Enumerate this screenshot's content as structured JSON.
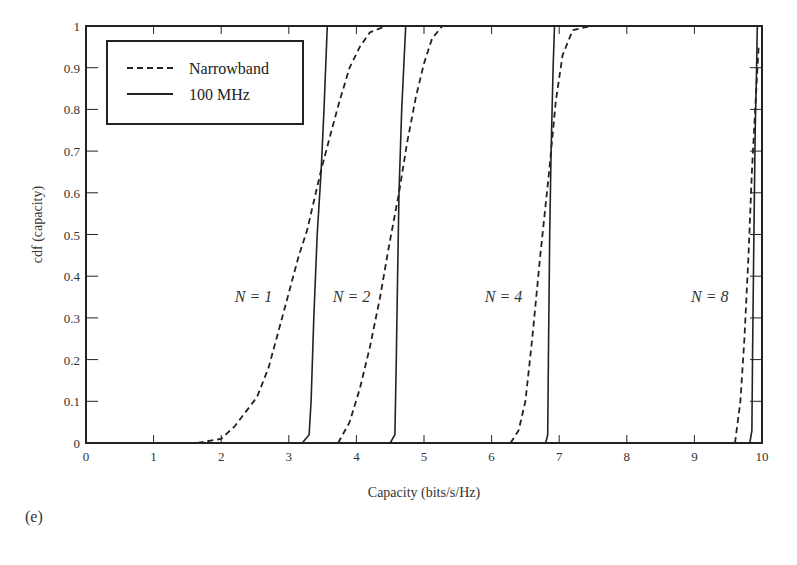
{
  "panel_label": "(e)",
  "chart_data": {
    "type": "line",
    "title": "",
    "xlabel": "Capacity (bits/s/Hz)",
    "ylabel": "cdf (capacity)",
    "xlim": [
      0,
      10
    ],
    "ylim": [
      0,
      1
    ],
    "xticks": [
      0,
      1,
      2,
      3,
      4,
      5,
      6,
      7,
      8,
      9,
      10
    ],
    "yticks": [
      0,
      0.1,
      0.2,
      0.3,
      0.4,
      0.5,
      0.6,
      0.7,
      0.8,
      0.9,
      1
    ],
    "ytick_labels": [
      "0",
      "0.1",
      "0.2",
      "0.3",
      "0.4",
      "0.5",
      "0.6",
      "0.7",
      "0.8",
      "0.9",
      "1"
    ],
    "grid": false,
    "legend": {
      "position": "upper left",
      "entries": [
        {
          "label": "Narrowband",
          "style": "dashed"
        },
        {
          "label": "100 MHz",
          "style": "solid"
        }
      ]
    },
    "annotations": [
      {
        "text": "N = 1",
        "x": 2.2,
        "y": 0.35
      },
      {
        "text": "N = 2",
        "x": 3.65,
        "y": 0.35
      },
      {
        "text": "N = 4",
        "x": 5.9,
        "y": 0.35
      },
      {
        "text": "N = 8",
        "x": 8.95,
        "y": 0.35
      }
    ],
    "series": [
      {
        "name": "Narrowband N=1",
        "style": "dashed",
        "points": [
          [
            1.65,
            0
          ],
          [
            2.0,
            0.01
          ],
          [
            2.2,
            0.04
          ],
          [
            2.53,
            0.11
          ],
          [
            2.7,
            0.18
          ],
          [
            2.85,
            0.27
          ],
          [
            3.0,
            0.36
          ],
          [
            3.15,
            0.45
          ],
          [
            3.27,
            0.51
          ],
          [
            3.4,
            0.6
          ],
          [
            3.48,
            0.655
          ],
          [
            3.6,
            0.73
          ],
          [
            3.75,
            0.82
          ],
          [
            3.9,
            0.9
          ],
          [
            4.05,
            0.95
          ],
          [
            4.2,
            0.985
          ],
          [
            4.44,
            1.0
          ]
        ]
      },
      {
        "name": "100 MHz N=1",
        "style": "solid",
        "points": [
          [
            3.2,
            0
          ],
          [
            3.3,
            0.02
          ],
          [
            3.33,
            0.1
          ],
          [
            3.37,
            0.3
          ],
          [
            3.42,
            0.5
          ],
          [
            3.48,
            0.655
          ],
          [
            3.52,
            0.8
          ],
          [
            3.57,
            1.0
          ]
        ]
      },
      {
        "name": "Narrowband N=2",
        "style": "dashed",
        "points": [
          [
            3.73,
            0
          ],
          [
            3.9,
            0.05
          ],
          [
            4.05,
            0.13
          ],
          [
            4.2,
            0.23
          ],
          [
            4.35,
            0.35
          ],
          [
            4.48,
            0.47
          ],
          [
            4.63,
            0.6
          ],
          [
            4.75,
            0.72
          ],
          [
            4.88,
            0.83
          ],
          [
            5.0,
            0.91
          ],
          [
            5.12,
            0.97
          ],
          [
            5.27,
            1.0
          ]
        ]
      },
      {
        "name": "100 MHz N=2",
        "style": "solid",
        "points": [
          [
            4.5,
            0
          ],
          [
            4.57,
            0.02
          ],
          [
            4.59,
            0.2
          ],
          [
            4.61,
            0.4
          ],
          [
            4.63,
            0.6
          ],
          [
            4.67,
            0.8
          ],
          [
            4.73,
            1.0
          ]
        ]
      },
      {
        "name": "Narrowband N=4",
        "style": "dashed",
        "points": [
          [
            6.28,
            0
          ],
          [
            6.4,
            0.03
          ],
          [
            6.5,
            0.1
          ],
          [
            6.6,
            0.25
          ],
          [
            6.72,
            0.45
          ],
          [
            6.85,
            0.65
          ],
          [
            6.95,
            0.82
          ],
          [
            7.05,
            0.93
          ],
          [
            7.2,
            0.99
          ],
          [
            7.47,
            1.0
          ]
        ]
      },
      {
        "name": "100 MHz N=4",
        "style": "solid",
        "points": [
          [
            6.8,
            0
          ],
          [
            6.83,
            0.02
          ],
          [
            6.84,
            0.2
          ],
          [
            6.86,
            0.5
          ],
          [
            6.88,
            0.7
          ],
          [
            6.91,
            0.9
          ],
          [
            6.93,
            1.0
          ]
        ]
      },
      {
        "name": "Narrowband N=8",
        "style": "dashed",
        "points": [
          [
            9.6,
            0
          ],
          [
            9.68,
            0.1
          ],
          [
            9.74,
            0.25
          ],
          [
            9.8,
            0.45
          ],
          [
            9.85,
            0.65
          ],
          [
            9.9,
            0.8
          ],
          [
            9.95,
            0.95
          ]
        ]
      },
      {
        "name": "100 MHz N=8",
        "style": "solid",
        "points": [
          [
            9.82,
            0
          ],
          [
            9.85,
            0.03
          ],
          [
            9.86,
            0.2
          ],
          [
            9.88,
            0.5
          ],
          [
            9.9,
            0.75
          ],
          [
            9.92,
            0.9
          ],
          [
            9.93,
            1.0
          ]
        ]
      }
    ]
  }
}
